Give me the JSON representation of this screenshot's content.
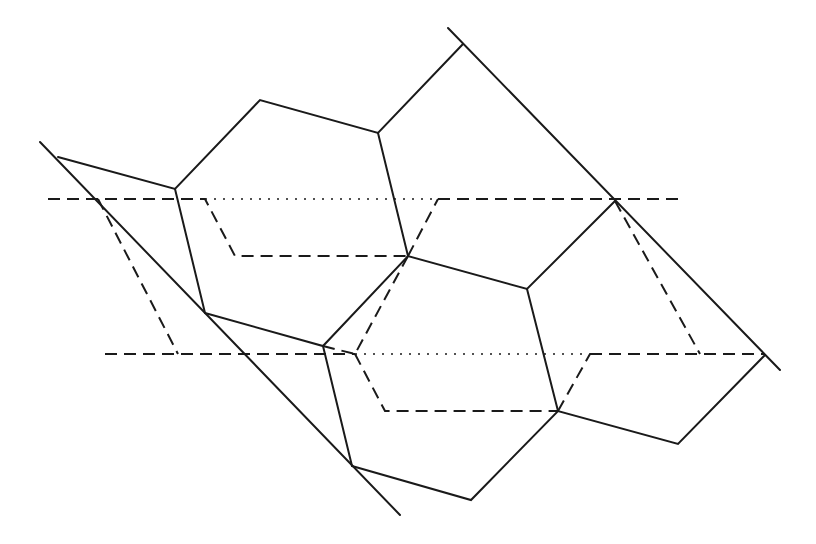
{
  "diagram": {
    "width": 816,
    "height": 544,
    "background": "#ffffff",
    "stroke_color": "#1a1a1a",
    "solid_stroke_width": 2,
    "dashed_stroke_width": 2,
    "dotted_stroke_width": 1.5,
    "dash_pattern": "12 7",
    "dot_pattern": "2 7",
    "vertices": {
      "P0": [
        58,
        157
      ],
      "A": [
        175,
        189
      ],
      "B": [
        260,
        100
      ],
      "C": [
        378,
        133
      ],
      "T": [
        463,
        44
      ],
      "D": [
        408,
        256
      ],
      "F": [
        615,
        201
      ],
      "E": [
        527,
        289
      ],
      "G": [
        205,
        313
      ],
      "H": [
        323,
        346
      ],
      "I": [
        352,
        466
      ],
      "J": [
        471,
        500
      ],
      "K": [
        558,
        411
      ],
      "L": [
        678,
        444
      ],
      "M": [
        765,
        355
      ]
    },
    "solid_polylines": [
      {
        "name": "left-boundary-line",
        "points": [
          [
            40,
            142
          ],
          [
            400,
            515
          ]
        ]
      },
      {
        "name": "right-boundary-line",
        "points": [
          [
            448,
            28
          ],
          [
            780,
            370
          ]
        ]
      },
      {
        "name": "cell-top-left",
        "points": [
          [
            58,
            157
          ],
          [
            175,
            189
          ],
          [
            260,
            100
          ],
          [
            378,
            133
          ],
          [
            463,
            44
          ]
        ]
      },
      {
        "name": "edge-A-G",
        "points": [
          [
            175,
            189
          ],
          [
            205,
            313
          ]
        ]
      },
      {
        "name": "edge-C-D",
        "points": [
          [
            378,
            133
          ],
          [
            408,
            256
          ]
        ]
      },
      {
        "name": "cell-middle",
        "points": [
          [
            205,
            313
          ],
          [
            323,
            346
          ],
          [
            408,
            256
          ],
          [
            527,
            289
          ],
          [
            615,
            201
          ]
        ]
      },
      {
        "name": "edge-H-I",
        "points": [
          [
            323,
            346
          ],
          [
            352,
            466
          ]
        ]
      },
      {
        "name": "edge-E-K",
        "points": [
          [
            527,
            289
          ],
          [
            558,
            411
          ]
        ]
      },
      {
        "name": "cell-bottom",
        "points": [
          [
            352,
            466
          ],
          [
            471,
            500
          ],
          [
            558,
            411
          ],
          [
            678,
            444
          ],
          [
            765,
            355
          ]
        ]
      }
    ],
    "dashed_polylines": [
      {
        "name": "upper-dashed-left",
        "points": [
          [
            48,
            199
          ],
          [
            205,
            199
          ],
          [
            235,
            256
          ],
          [
            408,
            256
          ]
        ]
      },
      {
        "name": "upper-dashed-right",
        "points": [
          [
            438,
            199
          ],
          [
            685,
            199
          ]
        ]
      },
      {
        "name": "upper-dashed-diagonal",
        "points": [
          [
            408,
            256
          ],
          [
            438,
            199
          ]
        ]
      },
      {
        "name": "left-dashed-diagonal",
        "points": [
          [
            98,
            199
          ],
          [
            178,
            354
          ]
        ]
      },
      {
        "name": "lower-dashed-left",
        "points": [
          [
            105,
            354
          ],
          [
            355,
            354
          ]
        ]
      },
      {
        "name": "lower-dashed-diagonal-1",
        "points": [
          [
            323,
            346
          ],
          [
            355,
            354
          ]
        ]
      },
      {
        "name": "lower-dashed-path",
        "points": [
          [
            355,
            354
          ],
          [
            385,
            411
          ],
          [
            558,
            411
          ]
        ]
      },
      {
        "name": "lower-dashed-diagonal-2",
        "points": [
          [
            558,
            411
          ],
          [
            590,
            354
          ]
        ]
      },
      {
        "name": "lower-dashed-right",
        "points": [
          [
            590,
            354
          ],
          [
            765,
            354
          ]
        ]
      },
      {
        "name": "right-dashed-diagonal",
        "points": [
          [
            615,
            201
          ],
          [
            700,
            354
          ]
        ]
      },
      {
        "name": "center-dashed-diagonal",
        "points": [
          [
            408,
            256
          ],
          [
            355,
            354
          ]
        ]
      }
    ],
    "dotted_polylines": [
      {
        "name": "upper-dotted",
        "points": [
          [
            205,
            199
          ],
          [
            438,
            199
          ]
        ]
      },
      {
        "name": "lower-dotted",
        "points": [
          [
            355,
            354
          ],
          [
            590,
            354
          ]
        ]
      }
    ]
  }
}
